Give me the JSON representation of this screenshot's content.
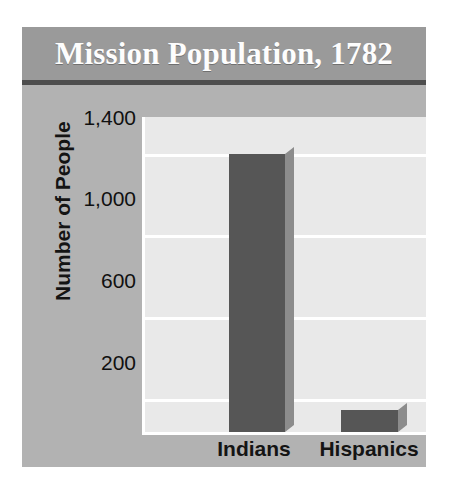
{
  "chart_data": {
    "type": "bar",
    "title": "Mission Population, 1782",
    "xlabel": "",
    "ylabel": "Number of People",
    "categories": [
      "Indians",
      "Hispanics"
    ],
    "values": [
      1400,
      110
    ],
    "series": [
      {
        "name": "Mission Population",
        "values": [
          1400,
          110
        ]
      }
    ],
    "yticks": [
      "200",
      "600",
      "1,000",
      "1,400"
    ],
    "ytick_values": [
      200,
      600,
      1000,
      1400
    ],
    "ylim": [
      0,
      1600
    ],
    "grid": true,
    "legend": false,
    "legend_position": "none",
    "bar_color": "#565656",
    "bar_shadow_color": "#8c8c8c",
    "plot_background": "#e9e9e9",
    "panel_background": "#b2b2b2",
    "title_band_color": "#9a9a9a",
    "title_text_color": "#fdfdfd",
    "gridline_color": "#ffffff",
    "rule_color": "#4e4e4e"
  }
}
